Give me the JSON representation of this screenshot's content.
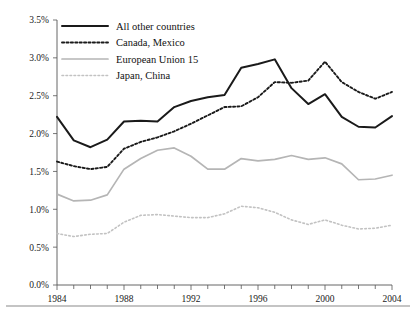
{
  "chart_data": {
    "type": "line",
    "title": "",
    "subtitle": "",
    "xlabel": "",
    "ylabel": "",
    "xlim": [
      1984,
      2004
    ],
    "ylim": [
      0.0,
      3.5
    ],
    "grid": false,
    "legend_position": "top-left",
    "x": [
      1984,
      1985,
      1986,
      1987,
      1988,
      1989,
      1990,
      1991,
      1992,
      1993,
      1994,
      1995,
      1996,
      1997,
      1998,
      1999,
      2000,
      2001,
      2002,
      2003,
      2004
    ],
    "x_tick_labels": [
      "1984",
      "1988",
      "1992",
      "1996",
      "2000",
      "2004"
    ],
    "x_tick_values": [
      1984,
      1988,
      1992,
      1996,
      2000,
      2004
    ],
    "x_minor_tick_values": [
      1985,
      1986,
      1987,
      1989,
      1990,
      1991,
      1993,
      1994,
      1995,
      1997,
      1998,
      1999,
      2001,
      2002,
      2003
    ],
    "y_tick_labels": [
      "0.0%",
      "0.5%",
      "1.0%",
      "1.5%",
      "2.0%",
      "2.5%",
      "3.0%",
      "3.5%"
    ],
    "y_tick_values": [
      0.0,
      0.5,
      1.0,
      1.5,
      2.0,
      2.5,
      3.0,
      3.5
    ],
    "series": [
      {
        "name": "All other countries",
        "style": "solid",
        "color": "#1a1a1a",
        "width": 2.0,
        "values": [
          2.22,
          1.91,
          1.82,
          1.92,
          2.16,
          2.17,
          2.16,
          2.35,
          2.43,
          2.48,
          2.51,
          2.87,
          2.92,
          2.98,
          2.6,
          2.39,
          2.52,
          2.22,
          2.09,
          2.08,
          2.23
        ]
      },
      {
        "name": "Canada, Mexico",
        "style": "dotted",
        "color": "#1a1a1a",
        "width": 1.9,
        "values": [
          1.63,
          1.57,
          1.53,
          1.56,
          1.8,
          1.89,
          1.95,
          2.03,
          2.13,
          2.24,
          2.35,
          2.36,
          2.48,
          2.68,
          2.67,
          2.7,
          2.95,
          2.68,
          2.55,
          2.46,
          2.55
        ]
      },
      {
        "name": "European Union 15",
        "style": "solid",
        "color": "#b5b5b5",
        "width": 1.7,
        "values": [
          1.2,
          1.11,
          1.12,
          1.19,
          1.53,
          1.67,
          1.78,
          1.81,
          1.7,
          1.53,
          1.53,
          1.67,
          1.64,
          1.66,
          1.71,
          1.66,
          1.68,
          1.6,
          1.39,
          1.4,
          1.45
        ]
      },
      {
        "name": "Japan, China",
        "style": "dotted",
        "color": "#c2c2c2",
        "width": 1.6,
        "values": [
          0.68,
          0.64,
          0.67,
          0.68,
          0.83,
          0.92,
          0.93,
          0.91,
          0.89,
          0.89,
          0.94,
          1.04,
          1.02,
          0.96,
          0.86,
          0.8,
          0.86,
          0.79,
          0.74,
          0.75,
          0.79
        ]
      }
    ]
  },
  "legend": {
    "items": [
      {
        "label": "All other countries"
      },
      {
        "label": "Canada, Mexico"
      },
      {
        "label": "European Union 15"
      },
      {
        "label": "Japan, China"
      }
    ]
  },
  "axis": {
    "y_labels": [
      "3.5%",
      "3.0%",
      "2.5%",
      "2.0%",
      "1.5%",
      "1.0%",
      "0.5%",
      "0.0%"
    ],
    "x_labels": [
      "1984",
      "1988",
      "1992",
      "1996",
      "2000",
      "2004"
    ]
  },
  "colors": {
    "series_dark": "#1a1a1a",
    "series_light_solid": "#b5b5b5",
    "series_light_dotted": "#c2c2c2",
    "axis": "#555555",
    "rule": "#8a8a8a",
    "background": "#ffffff"
  }
}
